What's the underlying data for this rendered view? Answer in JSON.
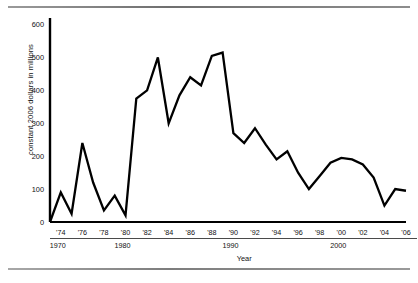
{
  "figure": {
    "ylabel": "constant 2006 dollars in millions",
    "xlabel": "Year",
    "source_note": ""
  },
  "chart_data": {
    "type": "line",
    "title": "",
    "xlabel": "Year",
    "ylabel": "constant 2006 dollars in millions",
    "xlim": [
      1973,
      2006
    ],
    "ylim": [
      0,
      620
    ],
    "yticks": [
      0,
      100,
      200,
      300,
      400,
      500,
      600
    ],
    "ytick_labels": [
      "0",
      "100",
      "200",
      "300",
      "400",
      "500",
      "600"
    ],
    "xticks": [
      1974,
      1976,
      1978,
      1980,
      1982,
      1984,
      1986,
      1988,
      1990,
      1992,
      1994,
      1996,
      1998,
      2000,
      2002,
      2004,
      2006
    ],
    "xtick_labels": [
      "'74",
      "'76",
      "'78",
      "'80",
      "'82",
      "'84",
      "'86",
      "'88",
      "'90",
      "'92",
      "'94",
      "'96",
      "'98",
      "'00",
      "'02",
      "'04",
      "'06"
    ],
    "decade_groups": [
      {
        "label": "1970",
        "start": 1974,
        "end": 1979
      },
      {
        "label": "1980",
        "start": 1980,
        "end": 1989
      },
      {
        "label": "1990",
        "start": 1990,
        "end": 1999
      },
      {
        "label": "2000",
        "start": 2000,
        "end": 2006
      }
    ],
    "grid": false,
    "legend": null,
    "x": [
      1973,
      1974,
      1975,
      1976,
      1977,
      1978,
      1979,
      1980,
      1981,
      1982,
      1983,
      1984,
      1985,
      1986,
      1987,
      1988,
      1989,
      1990,
      1991,
      1992,
      1993,
      1994,
      1995,
      1996,
      1997,
      1998,
      1999,
      2000,
      2001,
      2002,
      2003,
      2004,
      2005,
      2006
    ],
    "values": [
      0,
      90,
      25,
      240,
      120,
      35,
      80,
      20,
      375,
      400,
      500,
      300,
      385,
      440,
      415,
      505,
      515,
      270,
      240,
      285,
      235,
      190,
      215,
      150,
      100,
      140,
      180,
      195,
      190,
      175,
      135,
      50,
      100,
      95
    ]
  }
}
